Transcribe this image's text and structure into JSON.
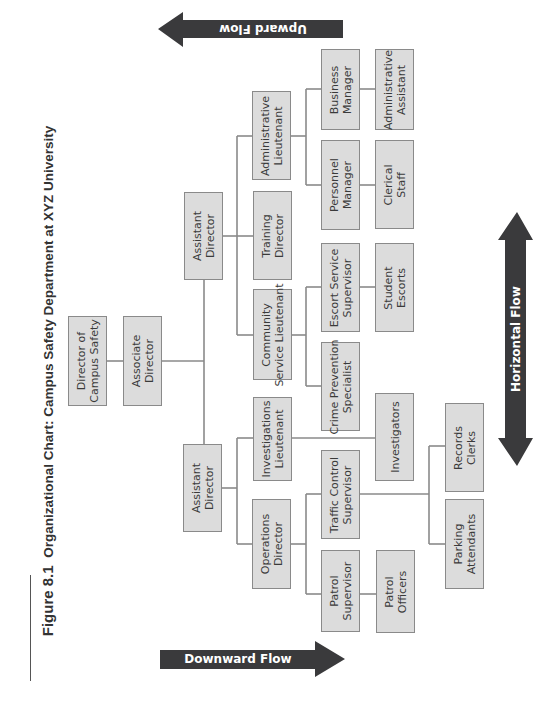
{
  "figure": {
    "number": "Figure 8.1",
    "title": "Organizational Chart: Campus Safety Department at XYZ University"
  },
  "arrows": {
    "upward": "Upward Flow",
    "downward": "Downward Flow",
    "horizontal": "Horizontal Flow"
  },
  "colors": {
    "box_fill": "#dcdcdc",
    "box_border": "#8a8a8a",
    "line": "#8a8a8a",
    "arrow_fill": "#3a3a3c",
    "text": "#3a3a3a"
  },
  "nodes": {
    "director": "Director of\nCampus Safety",
    "associate_director": "Associate\nDirector",
    "assistant_director_a": "Assistant\nDirector",
    "assistant_director_b": "Assistant\nDirector",
    "administrative_lieutenant": "Administrative\nLieutenant",
    "training_director": "Training\nDirector",
    "community_service_lieutenant": "Community\nService Lieutenant",
    "investigations_lieutenant": "Investigations\nLieutenant",
    "operations_director": "Operations\nDirector",
    "business_manager": "Business\nManager",
    "personnel_manager": "Personnel\nManager",
    "administrative_assistant": "Administrative\nAssistant",
    "clerical_staff": "Clerical\nStaff",
    "escort_service_supervisor": "Escort Service\nSupervisor",
    "crime_prevention_specialist": "Crime Prevention\nSpecialist",
    "student_escorts": "Student\nEscorts",
    "investigators": "Investigators",
    "traffic_control_supervisor": "Traffic Control\nSupervisor",
    "patrol_supervisor": "Patrol\nSupervisor",
    "patrol_officers": "Patrol\nOfficers",
    "records_clerks": "Records\nClerks",
    "parking_attendants": "Parking\nAttendants"
  },
  "hierarchy": [
    {
      "parent": "Director of Campus Safety",
      "children": [
        "Associate Director"
      ]
    },
    {
      "parent": "Associate Director",
      "children": [
        "Assistant Director (A)",
        "Assistant Director (B)"
      ]
    },
    {
      "parent": "Assistant Director (A)",
      "children": [
        "Administrative Lieutenant",
        "Training Director",
        "Community Service Lieutenant"
      ]
    },
    {
      "parent": "Assistant Director (B)",
      "children": [
        "Investigations Lieutenant",
        "Operations Director"
      ]
    },
    {
      "parent": "Administrative Lieutenant",
      "children": [
        "Business Manager",
        "Personnel Manager"
      ]
    },
    {
      "parent": "Business Manager",
      "children": [
        "Administrative Assistant"
      ]
    },
    {
      "parent": "Personnel Manager",
      "children": [
        "Clerical Staff"
      ]
    },
    {
      "parent": "Community Service Lieutenant",
      "children": [
        "Escort Service Supervisor",
        "Crime Prevention Specialist"
      ]
    },
    {
      "parent": "Escort Service Supervisor",
      "children": [
        "Student Escorts"
      ]
    },
    {
      "parent": "Investigations Lieutenant",
      "children": [
        "Investigators"
      ]
    },
    {
      "parent": "Operations Director",
      "children": [
        "Traffic Control Supervisor",
        "Patrol Supervisor"
      ]
    },
    {
      "parent": "Traffic Control Supervisor",
      "children": [
        "Records Clerks",
        "Parking Attendants"
      ]
    },
    {
      "parent": "Patrol Supervisor",
      "children": [
        "Patrol Officers"
      ]
    }
  ]
}
